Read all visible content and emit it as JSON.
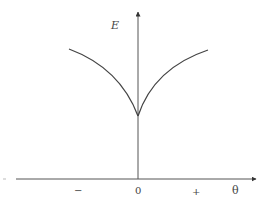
{
  "diagram": {
    "y_axis_label": "E",
    "x_axis_label": "θ",
    "x_ticks": [
      {
        "label": "−",
        "x": 77
      },
      {
        "label": "0",
        "x": 138
      },
      {
        "label": "+",
        "x": 195
      }
    ],
    "curve_description": "Energy E vs θ: symmetric cusp with minimum at θ=0, rising concavely on both sides",
    "colors": {
      "line": "#444444",
      "background": "#ffffff"
    }
  }
}
